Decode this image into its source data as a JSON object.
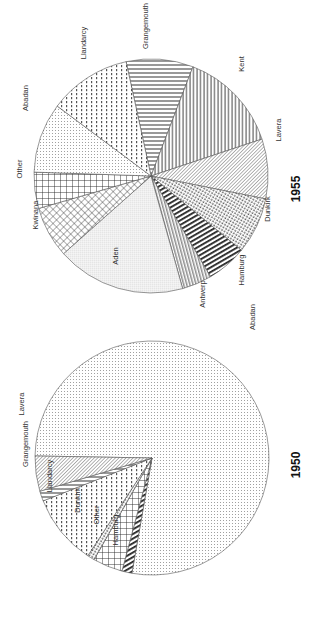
{
  "figure": {
    "orientation": "rotated 90 degrees counter-clockwise",
    "colors": {
      "ink": "#333333",
      "background": "#ffffff"
    }
  },
  "chart_data": [
    {
      "type": "pie",
      "title": "1955",
      "unit": "percent share (estimated from slice angles)",
      "slices": [
        {
          "label": "Grangemouth",
          "value": 9.3,
          "start_deg": 257.7,
          "end_deg": 291.0,
          "pattern": "hstripe"
        },
        {
          "label": "Kent",
          "value": 14.1,
          "start_deg": 291.0,
          "end_deg": 341.6,
          "pattern": "vstripe"
        },
        {
          "label": "Lavera",
          "value": 8.3,
          "start_deg": 341.6,
          "end_deg": 371.3,
          "pattern": "diag"
        },
        {
          "label": "Dunkirk",
          "value": 7.8,
          "start_deg": 11.3,
          "end_deg": 39.4,
          "pattern": "dots-dense"
        },
        {
          "label": "Hamburg",
          "value": 5.6,
          "start_deg": 39.4,
          "end_deg": 59.4,
          "pattern": "thick-stripe"
        },
        {
          "label": "Antwerp",
          "value": 4.1,
          "start_deg": 59.4,
          "end_deg": 74.3,
          "pattern": "zigzag"
        },
        {
          "label": "Aden",
          "value": 17.8,
          "start_deg": 74.3,
          "end_deg": 138.4,
          "pattern": "fine-dots"
        },
        {
          "label": "Kwinana",
          "value": 7.1,
          "start_deg": 138.4,
          "end_deg": 163.9,
          "pattern": "crosshatch-diag"
        },
        {
          "label": "Other",
          "value": 5.0,
          "start_deg": 163.9,
          "end_deg": 181.9,
          "pattern": "grid"
        },
        {
          "label": "Abadan",
          "value": 9.7,
          "start_deg": 181.9,
          "end_deg": 216.7,
          "pattern": "sparse-dots"
        },
        {
          "label": "Llandarcy",
          "value": 11.4,
          "start_deg": 216.7,
          "end_deg": 257.7,
          "pattern": "dash-dots"
        }
      ]
    },
    {
      "type": "pie",
      "title": "1950",
      "unit": "percent share (estimated from slice angles)",
      "slices": [
        {
          "label": "Abadan",
          "value": 77.5,
          "start_deg": 181.0,
          "end_deg": 459.9,
          "pattern": "sparse-dots"
        },
        {
          "label": "Hamburg",
          "value": 1.4,
          "start_deg": 99.9,
          "end_deg": 104.9,
          "pattern": "thick-stripe"
        },
        {
          "label": "Other",
          "value": 4.1,
          "start_deg": 104.9,
          "end_deg": 119.7,
          "pattern": "grid"
        },
        {
          "label": "Dunkirk",
          "value": 1.0,
          "start_deg": 119.7,
          "end_deg": 123.3,
          "pattern": "dots-dense"
        },
        {
          "label": "Llandarcy",
          "value": 9.8,
          "start_deg": 123.3,
          "end_deg": 158.5,
          "pattern": "dash-dots"
        },
        {
          "label": "Grangemouth",
          "value": 1.4,
          "start_deg": 158.5,
          "end_deg": 163.5,
          "pattern": "hstripe"
        },
        {
          "label": "Lavera",
          "value": 4.9,
          "start_deg": 163.5,
          "end_deg": 181.0,
          "pattern": "diag"
        }
      ]
    }
  ],
  "labels_1955": [
    {
      "text": "Grangemouth",
      "x": 148,
      "y": 26
    },
    {
      "text": "Kent",
      "x": 244,
      "y": 64
    },
    {
      "text": "Lavera",
      "x": 281,
      "y": 130
    },
    {
      "text": "Dunkirk",
      "x": 270,
      "y": 209
    },
    {
      "text": "Hamburg",
      "x": 244,
      "y": 270
    },
    {
      "text": "Antwerp",
      "x": 205,
      "y": 294
    },
    {
      "text": "Aden",
      "x": 118,
      "y": 256
    },
    {
      "text": "Kwinana",
      "x": 38,
      "y": 215
    },
    {
      "text": "Other",
      "x": 22,
      "y": 169
    },
    {
      "text": "Abadan",
      "x": 28,
      "y": 98
    },
    {
      "text": "Llandarcy",
      "x": 86,
      "y": 43
    }
  ],
  "labels_1950": [
    {
      "text": "Abadan",
      "x": 255,
      "y": 317
    },
    {
      "text": "Lavera",
      "x": 24,
      "y": 404
    },
    {
      "text": "Grangemouth",
      "x": 28,
      "y": 444
    },
    {
      "text": "Llandarcy",
      "x": 52,
      "y": 476
    },
    {
      "text": "Dunkirk",
      "x": 80,
      "y": 500
    },
    {
      "text": "Other",
      "x": 99,
      "y": 515
    },
    {
      "text": "Hamburg",
      "x": 118,
      "y": 530
    }
  ],
  "titles": {
    "t1955": "1955",
    "t1950": "1950"
  }
}
